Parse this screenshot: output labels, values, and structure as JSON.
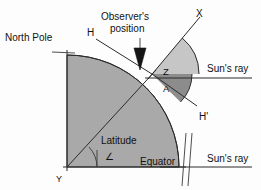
{
  "figure": {
    "background_color": "#fdfdfd",
    "earth_fill": "#a9a9a9",
    "wedge_z_fill": "#c2c2c2",
    "wedge_a_fill": "#8e8e8e",
    "line_color": "#2b2b2b"
  },
  "labels": {
    "north_pole": "North Pole",
    "observer_position_line1": "Observer's",
    "observer_position_line2": "position",
    "horizon_h": "H",
    "horizon_h_prime": "H'",
    "zenith_x": "X",
    "zenith_angle": "Z",
    "altitude_angle": "A",
    "suns_ray_top": "Sun's ray",
    "suns_ray_bottom": "Sun's ray",
    "latitude": "Latitude",
    "equator": "Equator",
    "center_y": "Y",
    "angle_symbol": "∠"
  },
  "geometry": {
    "center_y_point": [
      67,
      167
    ],
    "observer_point": [
      152,
      74
    ],
    "earth_radius": 112,
    "north_pole_point": [
      67,
      55
    ],
    "equator_point": [
      179,
      167
    ],
    "zenith_line_end": [
      199,
      18
    ],
    "horizon_h_end": [
      97,
      40
    ],
    "horizon_h_prime_end": [
      196,
      105
    ],
    "suns_ray_top_y": 78,
    "suns_ray_bottom_y": 167,
    "wedge_z_radius": 36,
    "wedge_a_radius": 27,
    "latitude_arc_radius": 30
  }
}
